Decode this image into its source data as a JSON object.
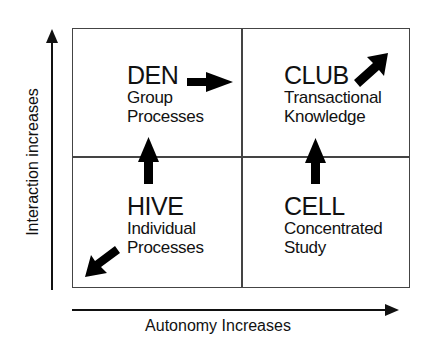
{
  "axes": {
    "y_label": "Interaction increases",
    "x_label": "Autonomy Increases"
  },
  "quadrants": [
    {
      "id": "den",
      "title": "DEN",
      "subtitle_1": "Group",
      "subtitle_2": "Processes",
      "position": "top-left"
    },
    {
      "id": "club",
      "title": "CLUB",
      "subtitle_1": "Transactional",
      "subtitle_2": "Knowledge",
      "position": "top-right"
    },
    {
      "id": "hive",
      "title": "HIVE",
      "subtitle_1": "Individual",
      "subtitle_2": "Processes",
      "position": "bottom-left"
    },
    {
      "id": "cell",
      "title": "CELL",
      "subtitle_1": "Concentrated",
      "subtitle_2": "Study",
      "position": "bottom-right"
    }
  ],
  "arrows": [
    {
      "from": "den",
      "to": "club",
      "direction": "right"
    },
    {
      "from": "hive",
      "to": "den",
      "direction": "up"
    },
    {
      "from": "cell",
      "to": "club",
      "direction": "up"
    },
    {
      "from": "club",
      "to": "outside",
      "direction": "up-right"
    },
    {
      "from": "hive",
      "to": "outside",
      "direction": "down-left"
    }
  ]
}
